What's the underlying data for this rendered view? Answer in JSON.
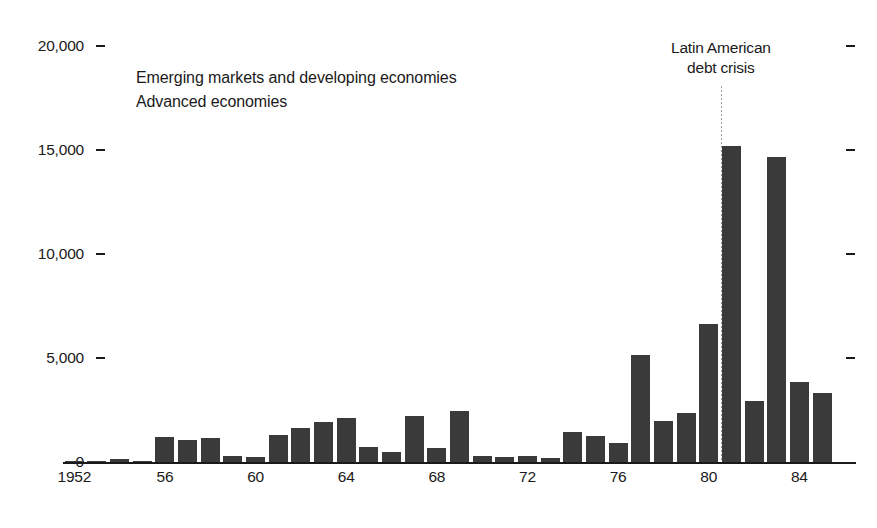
{
  "chart_data": {
    "type": "bar",
    "title": "",
    "subtitle": "",
    "xlabel": "",
    "ylabel": "",
    "ylim": [
      0,
      20000
    ],
    "xlim": [
      1952,
      1986
    ],
    "grid": false,
    "legend_position": "top-left",
    "bar_color": "#3a3a3a",
    "axis_color": "#1a1a1a",
    "y_ticks": [
      0,
      5000,
      10000,
      15000,
      20000
    ],
    "y_tick_labels": [
      "0",
      "5,000",
      "10,000",
      "15,000",
      "20,000"
    ],
    "y_ticks_mirrored_right": true,
    "x_tick_labels": [
      "1952",
      "56",
      "60",
      "64",
      "68",
      "72",
      "76",
      "80",
      "84"
    ],
    "x_tick_years": [
      1952,
      1956,
      1960,
      1964,
      1968,
      1972,
      1976,
      1980,
      1984
    ],
    "categories": [
      1952,
      1953,
      1954,
      1955,
      1956,
      1957,
      1958,
      1959,
      1960,
      1961,
      1962,
      1963,
      1964,
      1965,
      1966,
      1967,
      1968,
      1969,
      1970,
      1971,
      1972,
      1973,
      1974,
      1975,
      1976,
      1977,
      1978,
      1979,
      1980,
      1981,
      1982,
      1983,
      1984,
      1985,
      1986
    ],
    "series": [
      {
        "name": "Emerging markets and developing economies",
        "color": "#3a3a3a",
        "values": [
          60,
          40,
          130,
          30,
          1200,
          1050,
          1150,
          300,
          230,
          1300,
          1650,
          1900,
          2100,
          700,
          500,
          2200,
          650,
          2450,
          280,
          250,
          280,
          200,
          1450,
          1250,
          900,
          5150,
          1950,
          2350,
          6650,
          15200,
          2950,
          14650,
          3850,
          3300,
          0
        ]
      },
      {
        "name": "Advanced economies",
        "color": "#3a3a3a",
        "values": [
          0,
          0,
          0,
          0,
          0,
          0,
          0,
          0,
          0,
          0,
          0,
          0,
          0,
          0,
          0,
          0,
          0,
          0,
          0,
          0,
          0,
          0,
          0,
          0,
          0,
          0,
          0,
          0,
          0,
          0,
          0,
          0,
          0,
          0,
          0
        ]
      }
    ],
    "annotations": [
      {
        "text_line1": "Latin American",
        "text_line2": "debt crisis",
        "x_year": 1981,
        "marker": "dotted-vertical-line"
      }
    ]
  },
  "legend": {
    "items": [
      {
        "label": "Emerging markets and developing economies",
        "color": "#3a3a3a"
      },
      {
        "label": "Advanced economies",
        "color": "#3a3a3a"
      }
    ]
  }
}
